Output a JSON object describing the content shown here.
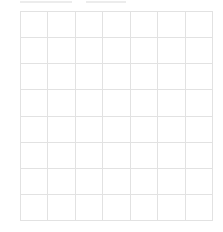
{
  "header": {
    "clipped_text_segments": [
      {
        "left": 0,
        "width": 52
      },
      {
        "left": 66,
        "width": 40
      }
    ],
    "note": ""
  },
  "grid": {
    "columns": 7,
    "rows": 8,
    "line_color": "#e2e2e2",
    "background": "#ffffff"
  }
}
